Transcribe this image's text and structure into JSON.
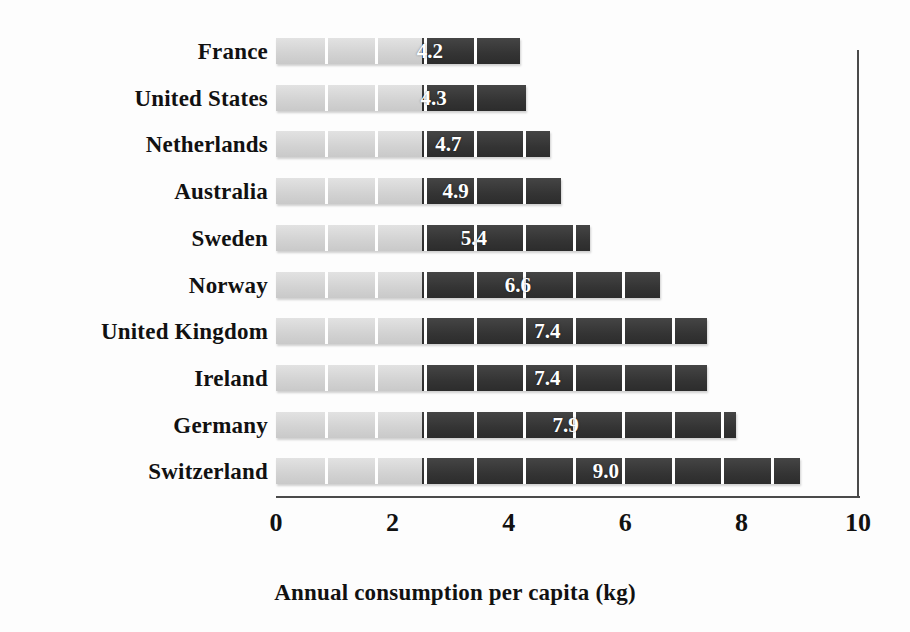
{
  "chart_data": {
    "type": "bar",
    "orientation": "horizontal",
    "title": "",
    "xlabel": "Annual consumption per capita (kg)",
    "ylabel": "",
    "xlim": [
      0,
      10
    ],
    "xticks": [
      "0",
      "2",
      "4",
      "6",
      "8",
      "10"
    ],
    "xtick_values": [
      0,
      2,
      4,
      6,
      8,
      10
    ],
    "grid": false,
    "legend": null,
    "categories": [
      "France",
      "United States",
      "Netherlands",
      "Australia",
      "Sweden",
      "Norway",
      "United Kingdom",
      "Ireland",
      "Germany",
      "Switzerland"
    ],
    "values": [
      4.2,
      4.3,
      4.7,
      4.9,
      5.4,
      6.6,
      7.4,
      7.4,
      7.9,
      9.0
    ],
    "value_labels": [
      "4.2",
      "4.3",
      "4.7",
      "4.9",
      "5.4",
      "6.6",
      "7.4",
      "7.4",
      "7.9",
      "9.0"
    ],
    "bars": [
      {
        "category": "France",
        "value": 4.2,
        "label": "4.2"
      },
      {
        "category": "United States",
        "value": 4.3,
        "label": "4.3"
      },
      {
        "category": "Netherlands",
        "value": 4.7,
        "label": "4.7"
      },
      {
        "category": "Australia",
        "value": 4.9,
        "label": "4.9"
      },
      {
        "category": "Sweden",
        "value": 5.4,
        "label": "5.4"
      },
      {
        "category": "Norway",
        "value": 6.6,
        "label": "6.6"
      },
      {
        "category": "United Kingdom",
        "value": 7.4,
        "label": "7.4"
      },
      {
        "category": "Ireland",
        "value": 7.4,
        "label": "7.4"
      },
      {
        "category": "Germany",
        "value": 7.9,
        "label": "7.9"
      },
      {
        "category": "Switzerland",
        "value": 9.0,
        "label": "9.0"
      }
    ],
    "colors": {
      "bar_light": "#d8d8d8",
      "bar_dark": "#3a3a3a",
      "axis": "#4a4a4a",
      "text": "#111111",
      "value_text": "#ffffff",
      "background": "#fdfdfd"
    },
    "segment_pattern": {
      "light_span_units": 2.5,
      "segment_width_units": 0.85,
      "description": "each bar is split into light-gray leading segments then dark segments, separated by thin white dividers"
    }
  }
}
